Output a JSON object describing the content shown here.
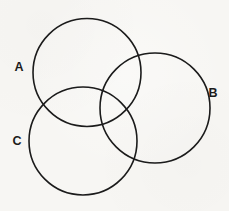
{
  "figure": {
    "kind": "venn-diagram",
    "background_color": "#f7f6f3",
    "stroke_color": "#1b1b1b",
    "label_color": "#1b1b1b",
    "width": 229,
    "height": 211
  },
  "labels": {
    "a": "A",
    "b": "B",
    "c": "C"
  },
  "chart_data": {
    "type": "diagram",
    "diagram_type": "venn",
    "title": "",
    "set_count": 3,
    "shaded_regions": [],
    "fill": "none",
    "stroke_color": "#1b1b1b",
    "stroke_width": 1.6,
    "background_color": "#f7f6f3",
    "sets": [
      {
        "label": "A",
        "cx": 87,
        "cy": 72.5,
        "r": 54,
        "label_x": 19,
        "label_y": 67,
        "label_position": "outside-left"
      },
      {
        "label": "B",
        "cx": 155,
        "cy": 108,
        "r": 55,
        "label_x": 213,
        "label_y": 93,
        "label_position": "outside-right"
      },
      {
        "label": "C",
        "cx": 83,
        "cy": 141,
        "r": 54,
        "label_x": 17,
        "label_y": 141,
        "label_position": "outside-left"
      }
    ],
    "axis_ranges": {
      "x": [
        0,
        229
      ],
      "y": [
        0,
        211
      ]
    },
    "grid": false,
    "legend": "none"
  }
}
